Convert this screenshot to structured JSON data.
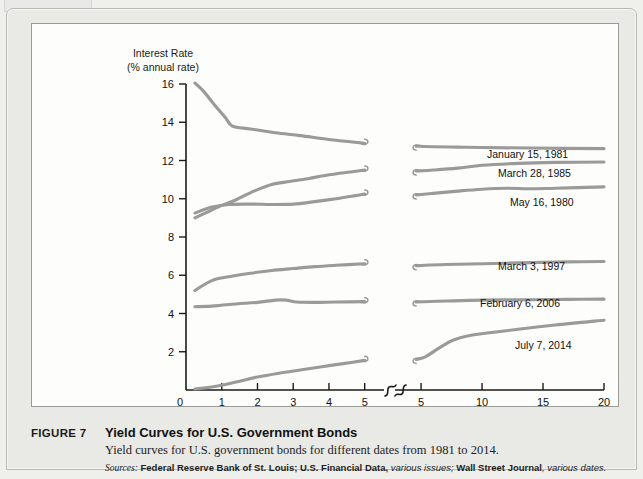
{
  "figure": {
    "number": "FIGURE 7",
    "title": "Yield Curves for U.S. Government Bonds",
    "subtitle": "Yield curves for U.S. government bonds for different dates from 1981 to 2014.",
    "sources_label": "Sources:",
    "sources_part1": "Federal Reserve Bank of St. Louis; U.S. Financial Data,",
    "sources_part2": "various issues;",
    "sources_part3": "Wall Street Journal",
    "sources_part4": ", various dates."
  },
  "chart_data": {
    "type": "line",
    "title": "",
    "ylabel_line1": "Interest Rate",
    "ylabel_line2": "(% annual rate)",
    "xlabel": "Terms to Maturity (Years)",
    "ylim": [
      0,
      16
    ],
    "yticks": [
      0,
      2,
      4,
      6,
      8,
      10,
      12,
      14,
      16
    ],
    "ytick_labels": [
      "0",
      "2",
      "4",
      "6",
      "8",
      "10",
      "12",
      "14",
      "16"
    ],
    "grid": false,
    "legend_position": "right-inline",
    "axis_break": true,
    "x_panels": [
      {
        "name": "left",
        "xlim": [
          0,
          5.4
        ],
        "xticks": [
          0,
          1,
          2,
          3,
          4,
          5
        ],
        "xtick_labels": [
          "0",
          "1",
          "2",
          "3",
          "4",
          "5"
        ]
      },
      {
        "name": "right",
        "xlim": [
          3.6,
          20
        ],
        "xticks": [
          5,
          10,
          15,
          20
        ],
        "xtick_labels": [
          "5",
          "10",
          "15",
          "20"
        ]
      }
    ],
    "series": [
      {
        "name": "January 15, 1981",
        "color": "#9a9a9a",
        "label": "January 15, 1981",
        "left_points": [
          [
            0.25,
            16.05
          ],
          [
            0.5,
            15.6
          ],
          [
            0.8,
            14.9
          ],
          [
            1.1,
            14.25
          ],
          [
            1.3,
            13.8
          ],
          [
            1.8,
            13.65
          ],
          [
            2.5,
            13.45
          ],
          [
            3.2,
            13.3
          ],
          [
            4.0,
            13.1
          ],
          [
            5.0,
            12.9
          ]
        ],
        "right_points": [
          [
            4.6,
            12.75
          ],
          [
            6,
            12.72
          ],
          [
            8,
            12.7
          ],
          [
            10,
            12.68
          ],
          [
            14,
            12.65
          ],
          [
            20,
            12.62
          ]
        ]
      },
      {
        "name": "March 28, 1985",
        "color": "#9a9a9a",
        "label": "March 28, 1985",
        "left_points": [
          [
            0.25,
            9.0
          ],
          [
            0.6,
            9.3
          ],
          [
            1.0,
            9.65
          ],
          [
            1.4,
            9.95
          ],
          [
            1.9,
            10.4
          ],
          [
            2.4,
            10.75
          ],
          [
            2.9,
            10.9
          ],
          [
            3.4,
            11.05
          ],
          [
            4.0,
            11.25
          ],
          [
            4.6,
            11.4
          ],
          [
            5.0,
            11.5
          ]
        ],
        "right_points": [
          [
            4.6,
            11.45
          ],
          [
            6,
            11.5
          ],
          [
            8,
            11.6
          ],
          [
            10,
            11.75
          ],
          [
            13,
            11.85
          ],
          [
            16,
            11.9
          ],
          [
            20,
            11.92
          ]
        ]
      },
      {
        "name": "May 16, 1980",
        "color": "#9a9a9a",
        "label": "May 16, 1980",
        "left_points": [
          [
            0.25,
            9.25
          ],
          [
            0.7,
            9.55
          ],
          [
            1.2,
            9.7
          ],
          [
            1.8,
            9.72
          ],
          [
            2.4,
            9.7
          ],
          [
            3.0,
            9.72
          ],
          [
            3.6,
            9.85
          ],
          [
            4.2,
            10.0
          ],
          [
            4.7,
            10.15
          ],
          [
            5.0,
            10.25
          ]
        ],
        "right_points": [
          [
            4.6,
            10.2
          ],
          [
            6,
            10.28
          ],
          [
            8,
            10.4
          ],
          [
            10,
            10.5
          ],
          [
            12,
            10.55
          ],
          [
            14,
            10.52
          ],
          [
            16,
            10.55
          ],
          [
            20,
            10.62
          ]
        ]
      },
      {
        "name": "March 3, 1997",
        "color": "#9a9a9a",
        "label": "March 3, 1997",
        "left_points": [
          [
            0.25,
            5.2
          ],
          [
            0.5,
            5.5
          ],
          [
            0.8,
            5.78
          ],
          [
            1.2,
            5.92
          ],
          [
            1.8,
            6.1
          ],
          [
            2.4,
            6.25
          ],
          [
            3.0,
            6.35
          ],
          [
            3.6,
            6.45
          ],
          [
            4.2,
            6.52
          ],
          [
            5.0,
            6.6
          ]
        ],
        "right_points": [
          [
            4.6,
            6.5
          ],
          [
            7,
            6.56
          ],
          [
            10,
            6.6
          ],
          [
            14,
            6.66
          ],
          [
            17,
            6.7
          ],
          [
            20,
            6.72
          ]
        ]
      },
      {
        "name": "February 6, 2006",
        "color": "#9a9a9a",
        "label": "February 6, 2006",
        "left_points": [
          [
            0.25,
            4.35
          ],
          [
            0.8,
            4.4
          ],
          [
            1.4,
            4.5
          ],
          [
            2.0,
            4.58
          ],
          [
            2.5,
            4.7
          ],
          [
            2.8,
            4.7
          ],
          [
            3.1,
            4.6
          ],
          [
            3.6,
            4.58
          ],
          [
            4.2,
            4.6
          ],
          [
            5.0,
            4.62
          ]
        ],
        "right_points": [
          [
            4.6,
            4.6
          ],
          [
            7,
            4.65
          ],
          [
            10,
            4.7
          ],
          [
            14,
            4.72
          ],
          [
            17,
            4.74
          ],
          [
            20,
            4.75
          ]
        ]
      },
      {
        "name": "July 7, 2014",
        "color": "#9a9a9a",
        "label": "July 7, 2014",
        "left_points": [
          [
            0.25,
            0.05
          ],
          [
            0.8,
            0.18
          ],
          [
            1.4,
            0.42
          ],
          [
            2.0,
            0.68
          ],
          [
            2.6,
            0.88
          ],
          [
            3.2,
            1.05
          ],
          [
            3.8,
            1.22
          ],
          [
            4.4,
            1.38
          ],
          [
            5.0,
            1.55
          ]
        ],
        "right_points": [
          [
            4.6,
            1.6
          ],
          [
            5.3,
            1.72
          ],
          [
            6.5,
            2.2
          ],
          [
            7.6,
            2.6
          ],
          [
            9.0,
            2.85
          ],
          [
            12,
            3.1
          ],
          [
            16,
            3.4
          ],
          [
            20,
            3.65
          ]
        ]
      }
    ],
    "series_label_positions": [
      {
        "label": "January 15, 1981",
        "x": 455,
        "y": 134
      },
      {
        "label": "March 28, 1985",
        "x": 466,
        "y": 153
      },
      {
        "label": "May 16, 1980",
        "x": 478,
        "y": 182
      },
      {
        "label": "March 3, 1997",
        "x": 466,
        "y": 246
      },
      {
        "label": "February 6, 2006",
        "x": 448,
        "y": 283
      },
      {
        "label": "July 7, 2014",
        "x": 483,
        "y": 325
      }
    ]
  }
}
